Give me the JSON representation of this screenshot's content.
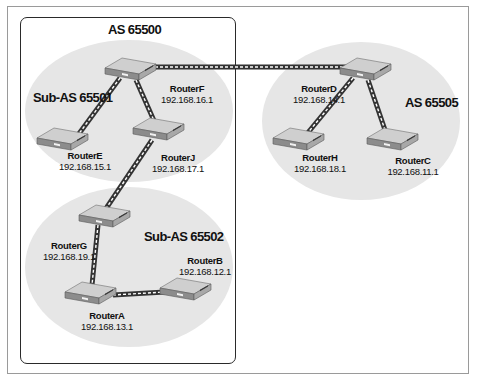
{
  "diagram": {
    "type": "network-topology",
    "autonomous_systems": [
      {
        "id": "as65500",
        "label": "AS 65500",
        "style": "rounded-rectangle",
        "sub_as": [
          {
            "id": "sub65501",
            "label": "Sub-AS 65501",
            "routers": [
              "RouterF",
              "RouterE",
              "RouterJ"
            ]
          },
          {
            "id": "sub65502",
            "label": "Sub-AS 65502",
            "routers": [
              "RouterG",
              "RouterA",
              "RouterB"
            ]
          }
        ]
      },
      {
        "id": "as65505",
        "label": "AS 65505",
        "style": "ellipse",
        "routers": [
          "RouterD",
          "RouterH",
          "RouterC"
        ]
      }
    ],
    "routers": {
      "F": {
        "name": "RouterF",
        "ip": "192.168.16.1"
      },
      "E": {
        "name": "RouterE",
        "ip": "192.168.15.1"
      },
      "J": {
        "name": "RouterJ",
        "ip": "192.168.17.1"
      },
      "G": {
        "name": "RouterG",
        "ip": "192.168.19.1"
      },
      "A": {
        "name": "RouterA",
        "ip": "192.168.13.1"
      },
      "B": {
        "name": "RouterB",
        "ip": "192.168.12.1"
      },
      "D": {
        "name": "RouterD",
        "ip": "192.168.14.1"
      },
      "H": {
        "name": "RouterH",
        "ip": "192.168.18.1"
      },
      "C": {
        "name": "RouterC",
        "ip": "192.168.11.1"
      }
    },
    "links": [
      [
        "RouterF",
        "RouterD"
      ],
      [
        "RouterF",
        "RouterE"
      ],
      [
        "RouterF",
        "RouterJ"
      ],
      [
        "RouterJ",
        "RouterG"
      ],
      [
        "RouterG",
        "RouterA"
      ],
      [
        "RouterA",
        "RouterB"
      ],
      [
        "RouterD",
        "RouterH"
      ],
      [
        "RouterD",
        "RouterC"
      ]
    ],
    "labels": {
      "as65500": "AS 65500",
      "sub65501": "Sub-AS 65501",
      "sub65502": "Sub-AS 65502",
      "as65505": "AS 65505"
    },
    "colors": {
      "region_fill": "#e6e6e6",
      "as_border": "#2a2a2a",
      "cable": "#3a3a3a",
      "router_top": "#c8c8c8",
      "router_side": "#8a8a8a"
    }
  }
}
